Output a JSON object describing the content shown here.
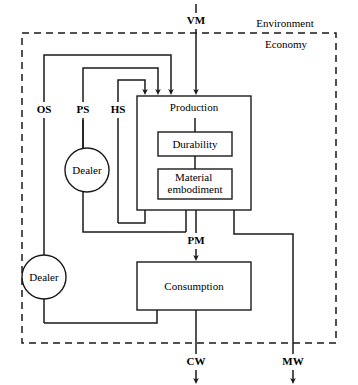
{
  "figure": {
    "type": "flow-diagram"
  },
  "zones": [
    {
      "id": "environment",
      "label": "Environment",
      "x": 285,
      "y": 24
    },
    {
      "id": "economy",
      "label": "Economy",
      "x": 286,
      "y": 44
    }
  ],
  "nodes": [
    {
      "id": "production",
      "label": "Production",
      "shape": "rect",
      "x": 137,
      "y": 96,
      "w": 114,
      "h": 114,
      "label_x": 194,
      "label_y": 108
    },
    {
      "id": "durability",
      "label": "Durability",
      "shape": "rect",
      "x": 158,
      "y": 132,
      "w": 74,
      "h": 24,
      "label_x": 195,
      "label_y": 144
    },
    {
      "id": "material-embodiment",
      "label": "Material embodiment",
      "line1": "Material",
      "line2": "embodiment",
      "shape": "rect",
      "x": 158,
      "y": 169,
      "w": 74,
      "h": 30,
      "label_x": 195,
      "label_y": 178
    },
    {
      "id": "consumption",
      "label": "Consumption",
      "shape": "rect",
      "x": 137,
      "y": 262,
      "w": 114,
      "h": 48,
      "label_x": 194,
      "label_y": 286
    },
    {
      "id": "dealer-upper",
      "label": "Dealer",
      "shape": "circle",
      "cx": 87,
      "cy": 170,
      "r": 22
    },
    {
      "id": "dealer-lower",
      "label": "Dealer",
      "shape": "circle",
      "cx": 44,
      "cy": 277,
      "r": 22
    }
  ],
  "flow_labels": [
    {
      "id": "vm",
      "label": "VM",
      "x": 196,
      "y": 20,
      "desc": "virgin material input"
    },
    {
      "id": "os",
      "label": "OS",
      "x": 44,
      "y": 109,
      "desc": "other services"
    },
    {
      "id": "ps",
      "label": "PS",
      "x": 83,
      "y": 109,
      "desc": "product services"
    },
    {
      "id": "hs",
      "label": "HS",
      "x": 118,
      "y": 109,
      "desc": "household services"
    },
    {
      "id": "pm",
      "label": "PM",
      "x": 196,
      "y": 240,
      "desc": "produced material"
    },
    {
      "id": "cw",
      "label": "CW",
      "x": 196,
      "y": 361,
      "desc": "consumption waste"
    },
    {
      "id": "mw",
      "label": "MW",
      "x": 293,
      "y": 361,
      "desc": "material waste"
    }
  ],
  "zone_boundary": {
    "x": 22,
    "y": 33,
    "w": 314,
    "h": 310
  },
  "colors": {
    "stroke": "#1a1a1a",
    "fill": "#ffffff",
    "background": "#ffffff"
  }
}
